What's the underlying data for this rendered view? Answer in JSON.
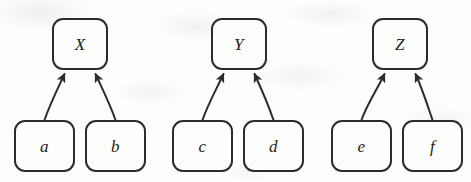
{
  "diagram": {
    "type": "directed-graph",
    "canvas": {
      "width": 471,
      "height": 182,
      "background": "#fdfdfc"
    },
    "style": {
      "stroke_color": "#2c2c2b",
      "stroke_width": 2,
      "node_fill": "#fdfdfc",
      "corner_radius": 11,
      "label_color": "#1d1d1c"
    },
    "nodes": [
      {
        "id": "X",
        "label": "X",
        "role": "parent",
        "x": 52,
        "y": 18,
        "w": 56,
        "h": 52
      },
      {
        "id": "Y",
        "label": "Y",
        "role": "parent",
        "x": 211,
        "y": 18,
        "w": 56,
        "h": 52
      },
      {
        "id": "Z",
        "label": "Z",
        "role": "parent",
        "x": 372,
        "y": 18,
        "w": 56,
        "h": 52
      },
      {
        "id": "a",
        "label": "a",
        "role": "child",
        "x": 14,
        "y": 120,
        "w": 61,
        "h": 52
      },
      {
        "id": "b",
        "label": "b",
        "role": "child",
        "x": 85,
        "y": 120,
        "w": 61,
        "h": 52
      },
      {
        "id": "c",
        "label": "c",
        "role": "child",
        "x": 172,
        "y": 120,
        "w": 61,
        "h": 52
      },
      {
        "id": "d",
        "label": "d",
        "role": "child",
        "x": 243,
        "y": 120,
        "w": 61,
        "h": 52
      },
      {
        "id": "e",
        "label": "e",
        "role": "child",
        "x": 331,
        "y": 120,
        "w": 61,
        "h": 52
      },
      {
        "id": "f",
        "label": "f",
        "role": "child",
        "x": 402,
        "y": 120,
        "w": 61,
        "h": 52
      }
    ],
    "edges": [
      {
        "id": "a-to-X",
        "from": "a",
        "to": "X",
        "arrowhead": "filled-triangle"
      },
      {
        "id": "b-to-X",
        "from": "b",
        "to": "X",
        "arrowhead": "filled-triangle"
      },
      {
        "id": "c-to-Y",
        "from": "c",
        "to": "Y",
        "arrowhead": "filled-triangle"
      },
      {
        "id": "d-to-Y",
        "from": "d",
        "to": "Y",
        "arrowhead": "filled-triangle"
      },
      {
        "id": "e-to-Z",
        "from": "e",
        "to": "Z",
        "arrowhead": "filled-triangle"
      },
      {
        "id": "f-to-Z",
        "from": "f",
        "to": "Z",
        "arrowhead": "filled-triangle"
      }
    ]
  }
}
